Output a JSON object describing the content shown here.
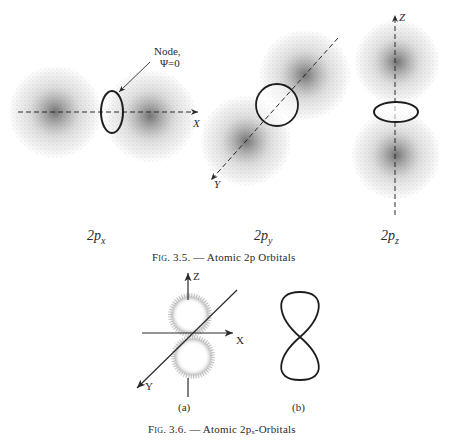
{
  "figure_3_5": {
    "orbitals": [
      {
        "id": "2px",
        "label_main": "2p",
        "label_sub": "x",
        "axis_label": "X"
      },
      {
        "id": "2py",
        "label_main": "2p",
        "label_sub": "y",
        "axis_label": "Y"
      },
      {
        "id": "2pz",
        "label_main": "2p",
        "label_sub": "z",
        "axis_label": "Z"
      }
    ],
    "node_annotation": {
      "line1": "Node,",
      "line2": "Ψ=0"
    },
    "caption": {
      "fig": "Fig. 3.5.",
      "dash": "—",
      "text": "Atomic 2p Orbitals"
    }
  },
  "figure_3_6": {
    "axes": {
      "z": "Z",
      "x": "X",
      "y": "Y"
    },
    "panels": [
      {
        "label": "(a)"
      },
      {
        "label": "(b)"
      }
    ],
    "caption": {
      "fig": "Fig. 3.6.",
      "dash": "—",
      "text": "Atomic 2pₓ-Orbitals"
    }
  },
  "colors": {
    "ink": "#2a2a2a",
    "stipple": "#6b6b6b",
    "page": "#ffffff"
  }
}
